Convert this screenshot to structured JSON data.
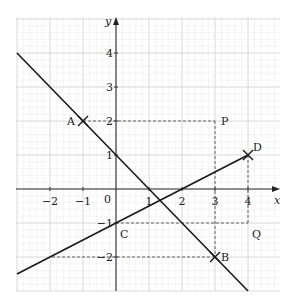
{
  "diagram": {
    "type": "coordinate-geometry",
    "axes": {
      "x_label": "x",
      "y_label": "y",
      "x_range": [
        -3,
        4.6
      ],
      "y_range": [
        -3,
        4.6
      ],
      "x_ticks": [
        {
          "value": -2,
          "label": "−2"
        },
        {
          "value": -1,
          "label": "−1"
        },
        {
          "value": 1,
          "label": "1"
        },
        {
          "value": 2,
          "label": "2"
        },
        {
          "value": 3,
          "label": "3"
        },
        {
          "value": 4,
          "label": "4"
        }
      ],
      "y_ticks": [
        {
          "value": 4,
          "label": "4"
        },
        {
          "value": 3,
          "label": "3"
        },
        {
          "value": 2,
          "label": "2"
        },
        {
          "value": 1,
          "label": "1"
        },
        {
          "value": -1,
          "label": "−1"
        },
        {
          "value": -2,
          "label": "−2"
        }
      ],
      "origin_label": "0",
      "grid": true,
      "minor_grid_per_unit": 5
    },
    "points": [
      {
        "name": "A",
        "x": -1,
        "y": 2,
        "marker": "cross",
        "label_pos": "left"
      },
      {
        "name": "B",
        "x": 3,
        "y": -2,
        "marker": "cross",
        "label_pos": "right"
      },
      {
        "name": "C",
        "x": 0,
        "y": -1,
        "marker": "none",
        "label_pos": "below-right"
      },
      {
        "name": "D",
        "x": 4,
        "y": 1,
        "marker": "cross",
        "label_pos": "above-right"
      },
      {
        "name": "P",
        "x": 3,
        "y": 2,
        "marker": "none",
        "label_pos": "right"
      },
      {
        "name": "Q",
        "x": 4,
        "y": -1,
        "marker": "none",
        "label_pos": "below-right"
      }
    ],
    "lines": [
      {
        "name": "line-AB",
        "from": [
          -3,
          4
        ],
        "to": [
          4,
          -3
        ]
      },
      {
        "name": "line-CD",
        "from": [
          -3,
          -2.5
        ],
        "to": [
          4,
          1
        ]
      }
    ],
    "dashed": [
      {
        "name": "dash-A-P",
        "from": [
          -1,
          2
        ],
        "to": [
          3,
          2
        ]
      },
      {
        "name": "dash-P-B",
        "from": [
          3,
          2
        ],
        "to": [
          3,
          -2
        ]
      },
      {
        "name": "dash-B-left",
        "from": [
          3,
          -2
        ],
        "to": [
          -2,
          -2
        ]
      },
      {
        "name": "dash-C-Q",
        "from": [
          0,
          -1
        ],
        "to": [
          4,
          -1
        ]
      },
      {
        "name": "dash-D-Q",
        "from": [
          4,
          1
        ],
        "to": [
          4,
          -1
        ]
      }
    ]
  }
}
